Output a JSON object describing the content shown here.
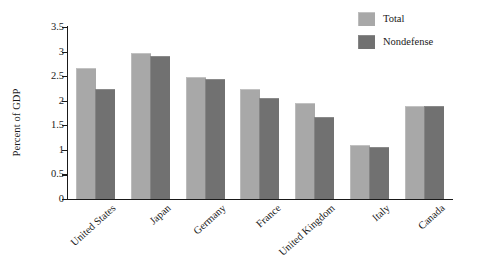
{
  "chart_data": {
    "type": "bar",
    "title": "",
    "subtitle": "",
    "xlabel": "",
    "ylabel": "Percent of GDP",
    "ylim": [
      0,
      3.5
    ],
    "yticks": [
      "0",
      "0.5",
      "1",
      "1.5",
      "2",
      "2.5",
      "3",
      "3.5"
    ],
    "ytick_values": [
      0,
      0.5,
      1,
      1.5,
      2,
      2.5,
      3,
      3.5
    ],
    "grid": false,
    "legend_position": "top-right",
    "categories": [
      "United States",
      "Japan",
      "Germany",
      "France",
      "United Kingdom",
      "Italy",
      "Canada"
    ],
    "series": [
      {
        "name": "Total",
        "color": "#a8a8a8",
        "values": [
          2.65,
          2.96,
          2.47,
          2.22,
          1.93,
          1.08,
          1.87
        ]
      },
      {
        "name": "Nondefense",
        "color": "#717171",
        "values": [
          2.21,
          2.9,
          2.43,
          2.03,
          1.65,
          1.03,
          1.87
        ]
      }
    ]
  },
  "legend": {
    "items": [
      {
        "label": "Total",
        "swatch": "total"
      },
      {
        "label": "Nondefense",
        "swatch": "nondefense"
      }
    ]
  },
  "colors": {
    "total": "#a8a8a8",
    "nondefense": "#717171",
    "axis": "#1a1a1a",
    "background": "#ffffff"
  }
}
